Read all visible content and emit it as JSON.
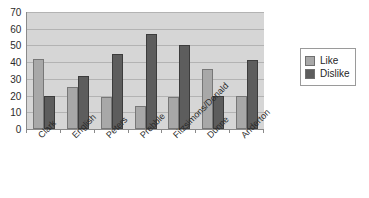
{
  "chart_data": {
    "type": "bar",
    "title": "",
    "xlabel": "",
    "ylabel": "",
    "ylim": [
      0,
      70
    ],
    "ytick_step": 10,
    "yticks": [
      70,
      60,
      50,
      40,
      30,
      20,
      10,
      0
    ],
    "grid": true,
    "legend_position": "right",
    "categories": [
      "Clark",
      "English",
      "Peters",
      "Prebble",
      "Fitzsimons/Donald",
      "Dunne",
      "Anderton"
    ],
    "series": [
      {
        "name": "Like",
        "color": "#a8a8a8",
        "values": [
          42,
          25,
          19,
          14,
          19,
          36,
          20
        ]
      },
      {
        "name": "Dislike",
        "color": "#5d5d5d",
        "values": [
          20,
          32,
          45,
          57,
          50,
          20,
          41
        ]
      }
    ]
  },
  "legend": {
    "entries": [
      {
        "label": "Like",
        "swatch": "like"
      },
      {
        "label": "Dislike",
        "swatch": "dislike"
      }
    ]
  },
  "colors": {
    "plot_background": "#d6d6d6",
    "gridline": "#b3b3b3",
    "axis": "#8a8a8a",
    "like": "#a8a8a8",
    "dislike": "#5d5d5d",
    "text": "#2b2b2b"
  }
}
